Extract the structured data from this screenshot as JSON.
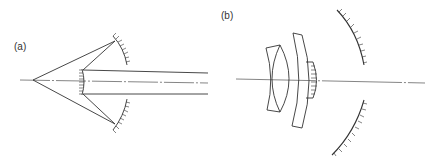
{
  "figure": {
    "panels": [
      {
        "id": "a",
        "label": "(a)",
        "description": "Two-mirror reflecting system: point source, concave primary mirror (upper and lower halves), small convex secondary mirror, parallel output beam along optical axis"
      },
      {
        "id": "b",
        "label": "(b)",
        "description": "Catadioptric system: meniscus lens pair, thick meniscus corrector, small mirror element, large concave mirror (upper and lower halves) along optical axis"
      }
    ],
    "colors": {
      "line": "#333333",
      "background": "#ffffff"
    }
  }
}
